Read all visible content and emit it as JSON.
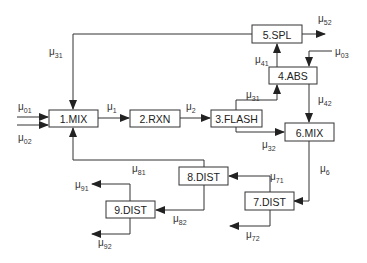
{
  "diagram": {
    "type": "process-flow",
    "units": [
      {
        "id": "1",
        "label": "1.MIX",
        "x": 49,
        "y": 110,
        "w": 49,
        "h": 17
      },
      {
        "id": "2",
        "label": "2.RXN",
        "x": 130,
        "y": 110,
        "w": 50,
        "h": 17
      },
      {
        "id": "3",
        "label": "3.FLASH",
        "x": 211,
        "y": 110,
        "w": 51,
        "h": 17
      },
      {
        "id": "4",
        "label": "4.ABS",
        "x": 269,
        "y": 67,
        "w": 48,
        "h": 17
      },
      {
        "id": "5",
        "label": "5.SPL",
        "x": 252,
        "y": 25,
        "w": 50,
        "h": 18
      },
      {
        "id": "6",
        "label": "6.MIX",
        "x": 285,
        "y": 123,
        "w": 49,
        "h": 18
      },
      {
        "id": "7",
        "label": "7.DIST",
        "x": 245,
        "y": 192,
        "w": 49,
        "h": 18
      },
      {
        "id": "8",
        "label": "8.DIST",
        "x": 179,
        "y": 167,
        "w": 49,
        "h": 18
      },
      {
        "id": "9",
        "label": "9.DIST",
        "x": 106,
        "y": 201,
        "w": 49,
        "h": 17
      }
    ],
    "streams": [
      {
        "name": "mu01",
        "base": "μ",
        "sub": "01",
        "lx": 18,
        "ly": 110,
        "from": "feed",
        "to": "1.MIX",
        "path": "M17,117 L48,117"
      },
      {
        "name": "mu02",
        "base": "μ",
        "sub": "02",
        "lx": 18,
        "ly": 141,
        "from": "feed",
        "to": "1.MIX",
        "path": "M17,125 L48,125"
      },
      {
        "name": "mu1",
        "base": "μ",
        "sub": "1",
        "lx": 107,
        "ly": 110,
        "from": "1.MIX",
        "to": "2.RXN",
        "path": "M98,118 L129,118"
      },
      {
        "name": "mu2",
        "base": "μ",
        "sub": "2",
        "lx": 186,
        "ly": 110,
        "from": "2.RXN",
        "to": "3.FLASH",
        "path": "M180,118 L210,118"
      },
      {
        "name": "mu31",
        "base": "μ",
        "sub": "31",
        "lx": 246,
        "ly": 98,
        "from": "3.FLASH",
        "to": "4.ABS",
        "path": "M236,110 L236,100 L277,100 L277,85"
      },
      {
        "name": "mu31_recycle",
        "base": "μ",
        "sub": "31",
        "lx": 49,
        "ly": 55,
        "from": "5.SPL",
        "to": "1.MIX",
        "path": "M252,34 L73,34 L73,109"
      },
      {
        "name": "mu32",
        "base": "μ",
        "sub": "32",
        "lx": 262,
        "ly": 148,
        "from": "3.FLASH",
        "to": "6.MIX",
        "path": "M236,127 L236,132 L284,132"
      },
      {
        "name": "mu41",
        "base": "μ",
        "sub": "41",
        "lx": 255,
        "ly": 63,
        "from": "4.ABS",
        "to": "5.SPL",
        "path": "M277,67 L277,44"
      },
      {
        "name": "mu42",
        "base": "μ",
        "sub": "42",
        "lx": 318,
        "ly": 103,
        "from": "4.ABS",
        "to": "6.MIX",
        "path": "M309,84 L309,122"
      },
      {
        "name": "mu03",
        "base": "μ",
        "sub": "03",
        "lx": 335,
        "ly": 55,
        "from": "feed",
        "to": "4.ABS",
        "path": "M332,51 L309,51 L309,66"
      },
      {
        "name": "mu52",
        "base": "μ",
        "sub": "52",
        "lx": 318,
        "ly": 22,
        "from": "5.SPL",
        "to": "product",
        "path": "M302,34 L325,34"
      },
      {
        "name": "mu6",
        "base": "μ",
        "sub": "6",
        "lx": 320,
        "ly": 172,
        "from": "6.MIX",
        "to": "7.DIST",
        "path": "M309,141 L309,201 L294,201"
      },
      {
        "name": "mu71",
        "base": "μ",
        "sub": "71",
        "lx": 270,
        "ly": 180,
        "from": "7.DIST",
        "to": "8.DIST",
        "path": "M270,192 L270,176 L229,176"
      },
      {
        "name": "mu72",
        "base": "μ",
        "sub": "72",
        "lx": 246,
        "ly": 238,
        "from": "7.DIST",
        "to": "product",
        "path": "M270,210 L270,226 L230,226"
      },
      {
        "name": "mu81",
        "base": "μ",
        "sub": "81",
        "lx": 132,
        "ly": 172,
        "from": "8.DIST",
        "to": "1.MIX",
        "path": "M204,167 L204,160 L73,160 L73,128"
      },
      {
        "name": "mu82",
        "base": "μ",
        "sub": "82",
        "lx": 173,
        "ly": 222,
        "from": "8.DIST",
        "to": "9.DIST",
        "path": "M204,185 L204,210 L156,210"
      },
      {
        "name": "mu91",
        "base": "μ",
        "sub": "91",
        "lx": 75,
        "ly": 188,
        "from": "9.DIST",
        "to": "product",
        "path": "M130,201 L130,184 L92,184"
      },
      {
        "name": "mu92",
        "base": "μ",
        "sub": "92",
        "lx": 98,
        "ly": 246,
        "from": "9.DIST",
        "to": "product",
        "path": "M130,218 L130,234 L92,234"
      }
    ]
  }
}
